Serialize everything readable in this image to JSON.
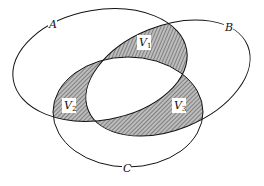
{
  "diagram": {
    "type": "venn",
    "sets": [
      {
        "name": "A"
      },
      {
        "name": "B"
      },
      {
        "name": "C"
      }
    ],
    "regions": [
      {
        "label": "V",
        "sub": "1"
      },
      {
        "label": "V",
        "sub": "2"
      },
      {
        "label": "V",
        "sub": "3"
      }
    ],
    "colors": {
      "stroke": "#111111",
      "hatch": "#555555",
      "background": "#ffffff"
    }
  }
}
